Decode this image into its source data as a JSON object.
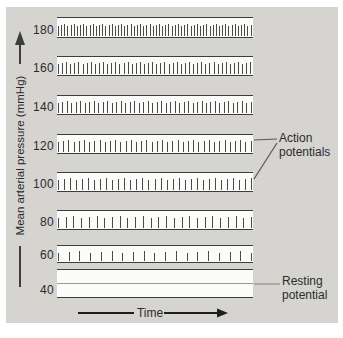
{
  "chart_data": {
    "type": "line",
    "title": "",
    "xlabel": "Time",
    "ylabel": "Mean arterial pressure (mmHg)",
    "categories": [
      180,
      160,
      140,
      120,
      100,
      80,
      60,
      40
    ],
    "series": [
      {
        "name": "action potentials per sweep (spike count)",
        "values": [
          62,
          48,
          44,
          38,
          33,
          26,
          19,
          0
        ]
      }
    ],
    "annotations": [
      "Action potentials",
      "Resting potential"
    ],
    "legend": "none"
  },
  "figure": {
    "y_axis_label": "Mean arterial pressure (mmHg)",
    "x_axis_label": "Time",
    "annotations": {
      "action_potentials": "Action potentials",
      "resting_potential": "Resting potential"
    },
    "traces": [
      {
        "pressure": "180",
        "spikes": 62
      },
      {
        "pressure": "160",
        "spikes": 48
      },
      {
        "pressure": "140",
        "spikes": 44
      },
      {
        "pressure": "120",
        "spikes": 38
      },
      {
        "pressure": "100",
        "spikes": 33
      },
      {
        "pressure": "80",
        "spikes": 26
      },
      {
        "pressure": "60",
        "spikes": 19
      },
      {
        "pressure": "40",
        "spikes": 0,
        "resting": true
      }
    ],
    "colors": {
      "panel_bg": "#d5d4d1",
      "band_bg": "#fbfbf9",
      "line": "#3d3d3d",
      "spike": "#4a4a4a",
      "resting_line": "#9a9a98",
      "text": "#2b2b2b"
    }
  }
}
